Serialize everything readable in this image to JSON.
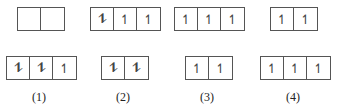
{
  "diagrams": [
    {
      "label": "(1)",
      "top": {
        "cells": [
          "",
          ""
        ]
      },
      "bottom": {
        "cells": [
          "⥮",
          "⥮",
          "↿"
        ]
      }
    },
    {
      "label": "(2)",
      "top": {
        "cells": [
          "⥮",
          "↿",
          "↿"
        ]
      },
      "bottom": {
        "cells": [
          "⥮",
          "⥮"
        ]
      }
    },
    {
      "label": "(3)",
      "top": {
        "cells": [
          "↿",
          "↿",
          "↿"
        ]
      },
      "bottom": {
        "cells": [
          "↿",
          "↿"
        ]
      }
    },
    {
      "label": "(4)",
      "top": {
        "cells": [
          "↿",
          "↿"
        ]
      },
      "bottom": {
        "cells": [
          "↿",
          "↿",
          "↿"
        ]
      }
    }
  ]
}
